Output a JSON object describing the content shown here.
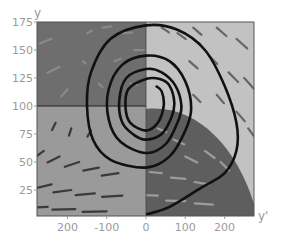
{
  "chart_data": {
    "type": "line",
    "title": "",
    "subtitle": "Phase portrait with direction field (spiral trajectory)",
    "xlabel": "y'",
    "ylabel": "y",
    "xlim": [
      -280,
      280
    ],
    "ylim": [
      0,
      175
    ],
    "grid": false,
    "legend": "none",
    "x_ticks": [
      {
        "value": -200,
        "label": "200"
      },
      {
        "value": -100,
        "label": "-100"
      },
      {
        "value": 0,
        "label": "0"
      },
      {
        "value": 100,
        "label": "100"
      },
      {
        "value": 200,
        "label": "200"
      }
    ],
    "y_ticks": [
      {
        "value": 25,
        "label": "25"
      },
      {
        "value": 50,
        "label": "50"
      },
      {
        "value": 75,
        "label": "75"
      },
      {
        "value": 100,
        "label": "100"
      },
      {
        "value": 125,
        "label": "125"
      },
      {
        "value": 150,
        "label": "150"
      },
      {
        "value": 175,
        "label": "175"
      }
    ],
    "equilibrium": {
      "x": 0,
      "y": 100
    },
    "regions": [
      {
        "name": "upper-left",
        "shade": "#6e6e6e"
      },
      {
        "name": "upper-right",
        "shade": "#c2c2c2"
      },
      {
        "name": "lower-left",
        "shade": "#9a9a9a"
      },
      {
        "name": "lower-right-inner",
        "shade": "#5e5e5e"
      },
      {
        "name": "lower-right-outer",
        "shade": "#c2c2c2"
      }
    ],
    "series": [
      {
        "name": "trajectory",
        "color": "#111111",
        "points": [
          [
            0,
            3
          ],
          [
            60,
            10
          ],
          [
            140,
            27
          ],
          [
            200,
            40
          ],
          [
            230,
            60
          ],
          [
            230,
            85
          ],
          [
            200,
            118
          ],
          [
            150,
            150
          ],
          [
            80,
            168
          ],
          [
            0,
            172
          ],
          [
            -90,
            160
          ],
          [
            -140,
            130
          ],
          [
            -150,
            100
          ],
          [
            -135,
            70
          ],
          [
            -90,
            52
          ],
          [
            0,
            45
          ],
          [
            60,
            55
          ],
          [
            100,
            78
          ],
          [
            115,
            98
          ],
          [
            100,
            122
          ],
          [
            60,
            140
          ],
          [
            0,
            145
          ],
          [
            -60,
            137
          ],
          [
            -95,
            115
          ],
          [
            -95,
            88
          ],
          [
            -65,
            68
          ],
          [
            0,
            58
          ],
          [
            50,
            66
          ],
          [
            80,
            85
          ],
          [
            90,
            100
          ],
          [
            75,
            118
          ],
          [
            40,
            130
          ],
          [
            0,
            133
          ],
          [
            -50,
            125
          ],
          [
            -68,
            105
          ],
          [
            -60,
            85
          ],
          [
            -30,
            74
          ],
          [
            0,
            70
          ],
          [
            40,
            75
          ],
          [
            65,
            90
          ],
          [
            72,
            103
          ],
          [
            60,
            118
          ],
          [
            35,
            124
          ],
          [
            0,
            124
          ],
          [
            -45,
            115
          ],
          [
            -52,
            98
          ],
          [
            -40,
            85
          ],
          [
            0,
            78
          ],
          [
            30,
            85
          ],
          [
            45,
            100
          ],
          [
            40,
            113
          ],
          [
            25,
            118
          ]
        ]
      }
    ],
    "direction_field": {
      "arrows_upper_left": [
        [
          -240,
          160,
          -20,
          -8
        ],
        [
          -220,
          135,
          -20,
          -10
        ],
        [
          -200,
          115,
          -10,
          -12
        ],
        [
          -150,
          165,
          8,
          4
        ],
        [
          -110,
          170,
          14,
          2
        ],
        [
          -60,
          165,
          16,
          1
        ],
        [
          -30,
          150,
          16,
          0
        ],
        [
          -80,
          140,
          10,
          4
        ],
        [
          -40,
          120,
          12,
          -2
        ],
        [
          -120,
          120,
          6,
          -6
        ],
        [
          -160,
          140,
          4,
          -4
        ]
      ],
      "arrows_upper_right": [
        [
          40,
          170,
          12,
          -8
        ],
        [
          80,
          165,
          14,
          -10
        ],
        [
          120,
          170,
          14,
          -12
        ],
        [
          180,
          170,
          16,
          -14
        ],
        [
          230,
          160,
          18,
          -16
        ],
        [
          60,
          140,
          10,
          -10
        ],
        [
          110,
          140,
          14,
          -12
        ],
        [
          160,
          145,
          14,
          -14
        ],
        [
          210,
          130,
          16,
          -16
        ],
        [
          250,
          125,
          16,
          -18
        ],
        [
          120,
          110,
          12,
          -12
        ],
        [
          180,
          110,
          12,
          -14
        ],
        [
          230,
          95,
          14,
          -16
        ],
        [
          260,
          80,
          12,
          -16
        ]
      ],
      "arrows_lower_left": [
        [
          -260,
          60,
          -16,
          -12
        ],
        [
          -220,
          55,
          -20,
          -10
        ],
        [
          -170,
          50,
          -24,
          -8
        ],
        [
          -120,
          45,
          -26,
          -5
        ],
        [
          -70,
          40,
          -28,
          -4
        ],
        [
          -240,
          30,
          -26,
          -6
        ],
        [
          -190,
          25,
          -30,
          -4
        ],
        [
          -130,
          22,
          -32,
          -3
        ],
        [
          -60,
          20,
          -34,
          -2
        ],
        [
          -250,
          10,
          -36,
          -2
        ],
        [
          -180,
          8,
          -38,
          -1
        ],
        [
          -100,
          6,
          -40,
          -1
        ],
        [
          -230,
          85,
          -6,
          -12
        ],
        [
          -190,
          80,
          -4,
          -12
        ],
        [
          -140,
          78,
          -6,
          -10
        ]
      ],
      "arrows_lower_right": [
        [
          30,
          80,
          14,
          -6
        ],
        [
          70,
          70,
          18,
          -8
        ],
        [
          100,
          55,
          20,
          -10
        ],
        [
          150,
          60,
          16,
          -12
        ],
        [
          190,
          50,
          14,
          -14
        ],
        [
          40,
          40,
          -20,
          2
        ],
        [
          100,
          35,
          -24,
          2
        ],
        [
          160,
          30,
          -24,
          4
        ],
        [
          30,
          20,
          -30,
          1
        ],
        [
          100,
          15,
          -32,
          1
        ],
        [
          170,
          12,
          -30,
          2
        ]
      ]
    }
  }
}
